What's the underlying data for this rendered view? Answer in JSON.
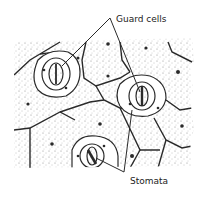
{
  "labels": {
    "guard_cells": "Guard cells",
    "stomata": "Stomata"
  },
  "colors": {
    "ink": "#2a2a2a",
    "background": "#ffffff",
    "stipple": "#8a8a8a"
  }
}
